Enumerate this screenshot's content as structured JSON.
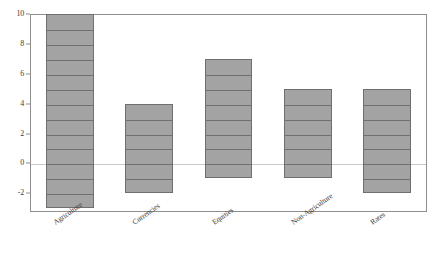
{
  "chart_data": {
    "type": "bar",
    "title": "",
    "subtitle": "",
    "xlabel": "",
    "ylabel": "",
    "categories": [
      "Agriculture",
      "Currencies",
      "Equities",
      "Non-Agriculture",
      "Rates"
    ],
    "bar_style": "floating-range",
    "series": [
      {
        "name": "Range low",
        "values": [
          -3,
          -2,
          -1,
          -1,
          -2
        ]
      },
      {
        "name": "Range high",
        "values": [
          10,
          4,
          7,
          5,
          5
        ]
      }
    ],
    "ranges": [
      {
        "category": "Agriculture",
        "low": -3,
        "high": 10
      },
      {
        "category": "Currencies",
        "low": -2,
        "high": 4
      },
      {
        "category": "Equities",
        "low": -1,
        "high": 7
      },
      {
        "category": "Non-Agriculture",
        "low": -1,
        "high": 5
      },
      {
        "category": "Rates",
        "low": -2,
        "high": 5
      }
    ],
    "ylim": [
      -3.25,
      10
    ],
    "yticks": [
      -2,
      0,
      2,
      4,
      6,
      8,
      10
    ],
    "ytick_labels": [
      "-2",
      "0",
      "2",
      "4",
      "6",
      "8",
      "10"
    ],
    "grid": "horizontal-unit-lines-inside-bars",
    "unit_gridline_step": 1,
    "zero_line": 0,
    "legend": "none",
    "legend_position": "none",
    "colors": {
      "bar_fill": "#a3a3a3",
      "bar_edge": "#6f6f6f",
      "gridline": "#5f5f5f",
      "zero_line": "#c9c9c9",
      "axis": "#8e8e8e",
      "text": "#3c3c3c",
      "background": "#ffffff"
    }
  }
}
